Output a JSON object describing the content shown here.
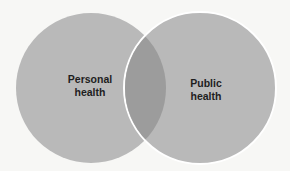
{
  "diagram": {
    "type": "venn",
    "sets": [
      {
        "label_line1": "Personal",
        "label_line2": "health"
      },
      {
        "label_line1": "Public",
        "label_line2": "health"
      }
    ],
    "colors": {
      "circle": "#b9b9b9",
      "overlap": "#9a9a9a",
      "separator": "#ffffff",
      "background": "#f7f7f5"
    }
  }
}
